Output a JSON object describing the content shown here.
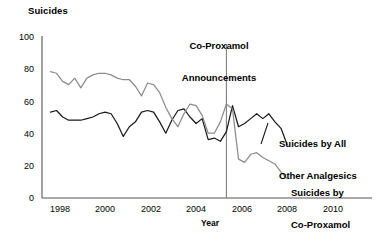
{
  "chart_data": {
    "type": "line",
    "title": "",
    "ylabel": "Suicides",
    "xlabel": "Year",
    "xlim": [
      1997.4,
      2011.0
    ],
    "ylim": [
      0,
      100
    ],
    "grid": false,
    "legend_position": "inline-right",
    "yticks": [
      0,
      20,
      40,
      60,
      80,
      100
    ],
    "xticks": [
      1998,
      2000,
      2002,
      2004,
      2006,
      2008,
      2010
    ],
    "annotations": [
      {
        "name": "co-proxamol-announcements",
        "text": "Co-Proxamol\nAnnouncements",
        "line1": "Co-Proxamol",
        "line2": "Announcements",
        "x": 2005,
        "vline": true,
        "vline_color": "#808080"
      }
    ],
    "series": [
      {
        "name": "Suicides by Co-Proxamol",
        "label_line1": "Suicides by",
        "label_line2": "Co-Proxamol",
        "color": "#8c8c8c",
        "x": [
          1997.75,
          1998.0,
          1998.25,
          1998.5,
          1998.75,
          1999.0,
          1999.25,
          1999.5,
          1999.75,
          2000.0,
          2000.25,
          2000.5,
          2000.75,
          2001.0,
          2001.25,
          2001.5,
          2001.75,
          2002.0,
          2002.25,
          2002.5,
          2002.75,
          2003.0,
          2003.25,
          2003.5,
          2003.75,
          2004.0,
          2004.25,
          2004.5,
          2004.75,
          2005.0,
          2005.25,
          2005.5,
          2005.75,
          2006.0,
          2006.25,
          2006.5,
          2006.75,
          2007.0,
          2007.25,
          2007.5
        ],
        "y": [
          78,
          77,
          72,
          70,
          74,
          68,
          74,
          76,
          77,
          77,
          76,
          74,
          73,
          73,
          69,
          63,
          71,
          70,
          65,
          56,
          49,
          44,
          52,
          58,
          57,
          51,
          40,
          40,
          47,
          58,
          55,
          24,
          22,
          27,
          28,
          25,
          23,
          21,
          16,
          12
        ]
      },
      {
        "name": "Suicides by All Other Analgesics",
        "label_line1": "Suicides by All",
        "label_line2": "Other Analgesics",
        "color": "#1a1a1a",
        "x": [
          1997.75,
          1998.0,
          1998.25,
          1998.5,
          1998.75,
          1999.0,
          1999.25,
          1999.5,
          1999.75,
          2000.0,
          2000.25,
          2000.5,
          2000.75,
          2001.0,
          2001.25,
          2001.5,
          2001.75,
          2002.0,
          2002.25,
          2002.5,
          2002.75,
          2003.0,
          2003.25,
          2003.5,
          2003.75,
          2004.0,
          2004.25,
          2004.5,
          2004.75,
          2005.0,
          2005.25,
          2005.5,
          2005.75,
          2006.0,
          2006.25,
          2006.5,
          2006.75,
          2007.0,
          2007.25,
          2007.5
        ],
        "y": [
          53,
          54,
          50,
          48,
          48,
          48,
          49,
          50,
          52,
          53,
          52,
          46,
          38,
          44,
          47,
          53,
          54,
          53,
          47,
          40,
          48,
          54,
          55,
          50,
          46,
          49,
          36,
          37,
          35,
          41,
          57,
          44,
          46,
          49,
          52,
          49,
          52,
          47,
          43,
          33
        ]
      }
    ]
  },
  "axis": {
    "y_title": "Suicides",
    "x_title": "Year",
    "y_ticks": [
      "100",
      "80",
      "60",
      "40",
      "20",
      "0"
    ],
    "x_ticks": [
      "1998",
      "2000",
      "2002",
      "2004",
      "2006",
      "2008",
      "2010"
    ]
  },
  "annotation": {
    "line1": "Co-Proxamol",
    "line2": "Announcements"
  },
  "legend": {
    "analgesics_line1": "Suicides by All",
    "analgesics_line2": "Other Analgesics",
    "coproxamol_line1": "Suicides by",
    "coproxamol_line2": "Co-Proxamol"
  },
  "colors": {
    "coproxamol": "#8c8c8c",
    "other_analgesics": "#1a1a1a",
    "axis": "#555555",
    "vline": "#808080"
  }
}
